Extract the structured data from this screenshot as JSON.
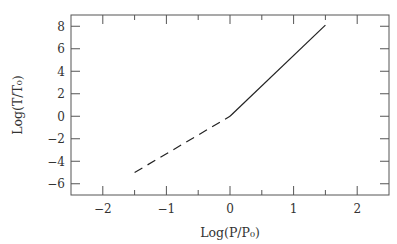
{
  "chart_data": {
    "type": "line",
    "title": "",
    "xlabel": "Log(P/P₀)",
    "ylabel": "Log(T/T₀)",
    "xlim": [
      -2.5,
      2.5
    ],
    "ylim": [
      -7,
      9
    ],
    "x_ticks_major": [
      -2,
      -1,
      0,
      1,
      2
    ],
    "x_tick_labels": [
      "−2",
      "−1",
      "0",
      "1",
      "2"
    ],
    "x_ticks_minor": [
      -1.5,
      -0.5,
      0.5,
      1.5
    ],
    "y_ticks_major": [
      -6,
      -4,
      -2,
      0,
      2,
      4,
      6,
      8
    ],
    "y_tick_labels": [
      "−6",
      "−4",
      "−2",
      "0",
      "2",
      "4",
      "6",
      "8"
    ],
    "grid": false,
    "legend": null,
    "series": [
      {
        "name": "dashed segment",
        "style": "dashed",
        "x": [
          -1.5,
          0
        ],
        "y": [
          -5.0,
          0
        ]
      },
      {
        "name": "solid segment",
        "style": "solid",
        "x": [
          0,
          1.5
        ],
        "y": [
          0,
          8.1
        ]
      }
    ]
  },
  "colors": {
    "axis": "#555555",
    "line": "#222222",
    "text": "#333333"
  }
}
